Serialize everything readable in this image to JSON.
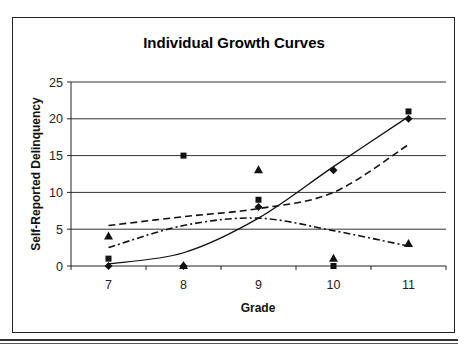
{
  "chart_data": {
    "type": "scatter",
    "title": "Individual Growth Curves",
    "xlabel": "Grade",
    "ylabel": "Self-Reported Delinquency",
    "categories": [
      "7",
      "8",
      "9",
      "10",
      "11"
    ],
    "ylim": [
      0,
      25
    ],
    "yticks": [
      0,
      5,
      10,
      15,
      20,
      25
    ],
    "grid": true,
    "legend": "none",
    "series": [
      {
        "name": "Individual A (diamond)",
        "marker": "diamond",
        "values": [
          0,
          0,
          8,
          13,
          20
        ]
      },
      {
        "name": "Individual B (square)",
        "marker": "square",
        "values": [
          1,
          15,
          9,
          0,
          21
        ]
      },
      {
        "name": "Individual C (triangle)",
        "marker": "triangle",
        "values": [
          4,
          0,
          13,
          1,
          3
        ]
      }
    ],
    "fitted_curves": [
      {
        "name": "Fit A",
        "style": "solid",
        "values": [
          0.3,
          1.8,
          6.5,
          13.5,
          20.3
        ]
      },
      {
        "name": "Fit B",
        "style": "dashed",
        "values": [
          5.5,
          6.7,
          7.8,
          10.0,
          16.5
        ]
      },
      {
        "name": "Fit C",
        "style": "dash-dot",
        "values": [
          2.5,
          5.5,
          6.5,
          4.8,
          2.7
        ]
      }
    ]
  }
}
